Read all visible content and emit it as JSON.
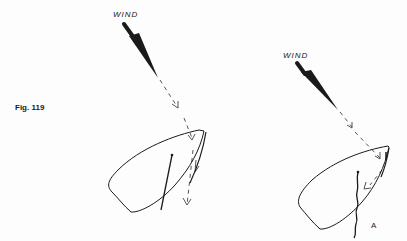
{
  "figure": {
    "number_label": "Fig. 119",
    "panels": [
      {
        "id": "left",
        "wind_label": "WIND",
        "description": "Sailboat hull outline with a mast line; dashed wind arrow deflecting off the sail and continuing downward"
      },
      {
        "id": "right",
        "wind_label": "WIND",
        "marker": "A",
        "description": "Sailboat hull outline with wavy line below mast; dashed wind arrow deflected back along sail"
      }
    ]
  },
  "colors": {
    "ink": "#1a1a1a",
    "dashed": "#555555",
    "background": "#fdfdfd"
  }
}
